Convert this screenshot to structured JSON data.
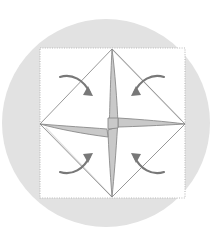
{
  "figure": {
    "caption": "",
    "width": 213,
    "height": 246,
    "background_color": "#ffffff"
  },
  "colors": {
    "page_background": "#ffffff",
    "circle_fill": "#e2e2e2",
    "paper_fill": "#ffffff",
    "paper_border": "#b9b9b9",
    "crease_line": "#8c8c8c",
    "ghost_line": "#e0e0e0",
    "pinwheel_fill": "#c9c9c9",
    "pinwheel_stroke": "#8a8a8a",
    "arrow_color": "#787878"
  },
  "circle": {
    "name": "background-circle",
    "cx": 106,
    "cy": 123,
    "r": 104,
    "fill": "#e2e2e2"
  },
  "paper_square": {
    "name": "paper-square",
    "x": 40,
    "y": 48,
    "width": 145,
    "height": 150,
    "fill": "#ffffff",
    "stroke": "#b9b9b9",
    "stroke_dasharray": "1 1.4",
    "stroke_width": 1.1
  },
  "diamond": {
    "name": "inscribed-diamond",
    "points": "112,49 185,124 112,197 40,124",
    "stroke": "#8c8c8c",
    "stroke_width": 0.9,
    "fill": "none",
    "vertices": [
      {
        "label": "top",
        "x": 112,
        "y": 49
      },
      {
        "label": "right",
        "x": 185,
        "y": 124
      },
      {
        "label": "bottom",
        "x": 112,
        "y": 197
      },
      {
        "label": "left",
        "x": 40,
        "y": 124
      }
    ]
  },
  "ghost_diagonals": {
    "name": "ghost-diagonal-lines",
    "stroke": "#e3e3e3",
    "stroke_width": 1.6,
    "segments": [
      {
        "x1": 112,
        "y1": 49,
        "x2": 181,
        "y2": 120
      },
      {
        "x1": 112,
        "y1": 197,
        "x2": 46,
        "y2": 128
      }
    ]
  },
  "pinwheel": {
    "name": "central-pinwheel",
    "fill": "#c9c9c9",
    "stroke": "#8a8a8a",
    "stroke_width": 0.9,
    "description": "Four-pointed star / pinwheel with curved tapered arms reaching the four diamond vertices",
    "arms": [
      {
        "label": "north-arm",
        "tip_x": 112,
        "tip_y": 49
      },
      {
        "label": "east-arm",
        "tip_x": 185,
        "tip_y": 124
      },
      {
        "label": "south-arm",
        "tip_x": 112,
        "tip_y": 197
      },
      {
        "label": "west-arm",
        "tip_x": 40,
        "tip_y": 124
      }
    ]
  },
  "arrows": [
    {
      "name": "fold-arrow-top-left",
      "label": "fold-down-right",
      "direction": "down-right",
      "quadrant": "top-left",
      "path": "M 60 77 C 72 73, 84 80, 90 93",
      "head": "88,86 93,96 83,95"
    },
    {
      "name": "fold-arrow-top-right",
      "label": "fold-down-left",
      "direction": "down-left",
      "quadrant": "top-right",
      "path": "M 164 77 C 152 73, 140 80, 134 93",
      "head": "136,86 131,96 141,95"
    },
    {
      "name": "fold-arrow-bottom-left",
      "label": "fold-up-right",
      "direction": "up-right",
      "quadrant": "bottom-left",
      "path": "M 60 172 C 72 176, 84 169, 90 156",
      "head": "88,163 93,153 83,154"
    },
    {
      "name": "fold-arrow-bottom-right",
      "label": "fold-up-left",
      "direction": "up-left",
      "quadrant": "bottom-right",
      "path": "M 164 172 C 152 176, 140 169, 134 156",
      "head": "136,163 131,153 141,154"
    }
  ],
  "legend": {
    "items": []
  },
  "labels": {
    "visible_text": []
  }
}
